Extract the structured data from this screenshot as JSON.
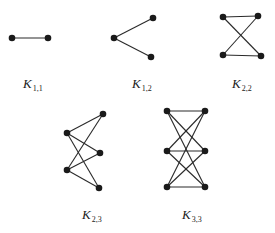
{
  "diagram": {
    "graphs": [
      {
        "id": "K11",
        "label": {
          "main": "K",
          "sub": "1,1",
          "x": 23,
          "y": 77
        },
        "vertices": [
          [
            12,
            38
          ],
          [
            48,
            38
          ]
        ],
        "edges": [
          [
            0,
            1
          ]
        ]
      },
      {
        "id": "K12",
        "label": {
          "main": "K",
          "sub": "1,2",
          "x": 132,
          "y": 77
        },
        "vertices": [
          [
            114,
            38
          ],
          [
            153,
            18
          ],
          [
            151,
            57
          ]
        ],
        "edges": [
          [
            0,
            1
          ],
          [
            0,
            2
          ]
        ]
      },
      {
        "id": "K22",
        "label": {
          "main": "K",
          "sub": "2,2",
          "x": 232,
          "y": 77
        },
        "vertices": [
          [
            223,
            17
          ],
          [
            258,
            16
          ],
          [
            223,
            55
          ],
          [
            261,
            56
          ]
        ],
        "edges": [
          [
            0,
            1
          ],
          [
            2,
            3
          ],
          [
            0,
            3
          ],
          [
            2,
            1
          ]
        ]
      },
      {
        "id": "K23",
        "label": {
          "main": "K",
          "sub": "2,3",
          "x": 82,
          "y": 208
        },
        "vertices": [
          [
            67,
            133
          ],
          [
            67,
            170
          ],
          [
            103,
            114
          ],
          [
            100,
            153
          ],
          [
            99,
            188
          ]
        ],
        "edges": [
          [
            0,
            2
          ],
          [
            0,
            3
          ],
          [
            0,
            4
          ],
          [
            1,
            2
          ],
          [
            1,
            3
          ],
          [
            1,
            4
          ]
        ]
      },
      {
        "id": "K33",
        "label": {
          "main": "K",
          "sub": "3,3",
          "x": 182,
          "y": 208
        },
        "vertices": [
          [
            167,
            111
          ],
          [
            167,
            151
          ],
          [
            167,
            187
          ],
          [
            205,
            111
          ],
          [
            205,
            151
          ],
          [
            205,
            187
          ]
        ],
        "edges": [
          [
            0,
            3
          ],
          [
            0,
            4
          ],
          [
            0,
            5
          ],
          [
            1,
            3
          ],
          [
            1,
            4
          ],
          [
            1,
            5
          ],
          [
            2,
            3
          ],
          [
            2,
            4
          ],
          [
            2,
            5
          ]
        ]
      }
    ]
  }
}
